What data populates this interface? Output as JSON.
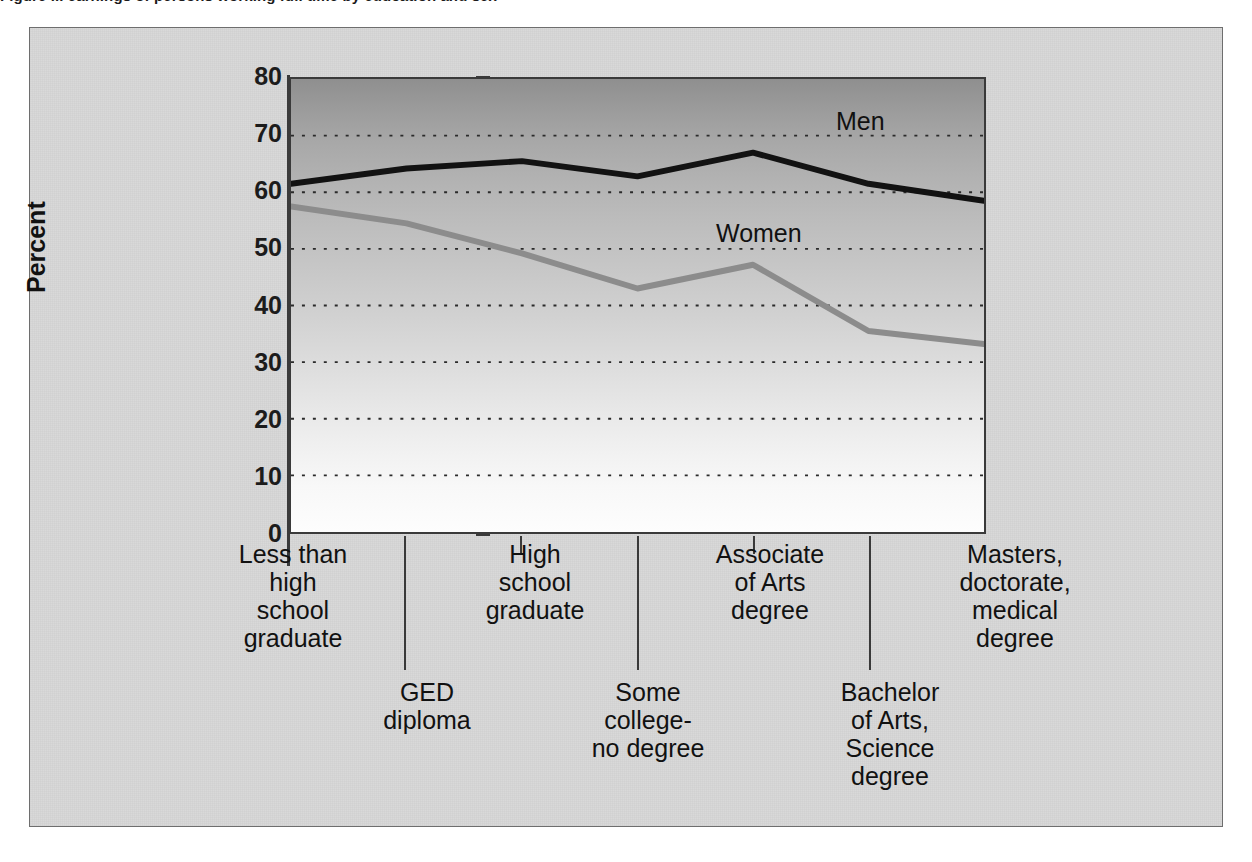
{
  "figure": {
    "title_cropped": "Figure ... earnings of persons working full time by education and sex"
  },
  "chart_data": {
    "type": "line",
    "title": "",
    "xlabel": "",
    "ylabel": "Percent",
    "ylim": [
      0,
      80
    ],
    "ytick_step": 10,
    "yticks": [
      "0",
      "10",
      "20",
      "30",
      "40",
      "50",
      "60",
      "70",
      "80"
    ],
    "grid": "horizontal-dotted",
    "legend": "in-plot-labels",
    "categories": [
      "Less than high school graduate",
      "GED diploma",
      "High school graduate",
      "Some college-no degree",
      "Associate of Arts degree",
      "Bachelor of Arts, Science degree",
      "Masters, doctorate, medical degree"
    ],
    "category_label_rows": [
      "top",
      "bottom",
      "top",
      "bottom",
      "top",
      "bottom",
      "top"
    ],
    "category_labels_display": [
      "Less than\nhigh\nschool\ngraduate",
      "GED\ndiploma",
      "High\nschool\ngraduate",
      "Some\ncollege-\nno degree",
      "Associate\nof Arts\ndegree",
      "Bachelor\nof Arts,\nScience\ndegree",
      "Masters,\ndoctorate,\nmedical\ndegree"
    ],
    "series": [
      {
        "name": "Men",
        "color": "#121212",
        "values": [
          61.5,
          64.2,
          65.5,
          62.8,
          67.0,
          61.5,
          58.5
        ]
      },
      {
        "name": "Women",
        "color": "#8c8c8c",
        "values": [
          57.5,
          54.5,
          49.2,
          43.0,
          47.2,
          35.5,
          33.2
        ]
      }
    ]
  },
  "axis": {
    "y_title": "Percent",
    "y_tick_labels": [
      "80",
      "70",
      "60",
      "50",
      "40",
      "30",
      "20",
      "10",
      "0"
    ]
  },
  "series_labels": {
    "men": "Men",
    "women": "Women"
  },
  "x_labels": {
    "less_than_hs": "Less than\nhigh\nschool\ngraduate",
    "ged": "GED\ndiploma",
    "hs_grad": "High\nschool\ngraduate",
    "some_college": "Some\ncollege-\nno degree",
    "associate": "Associate\nof Arts\ndegree",
    "bachelor": "Bachelor\nof Arts,\nScience\ndegree",
    "masters": "Masters,\ndoctorate,\nmedical\ndegree"
  }
}
